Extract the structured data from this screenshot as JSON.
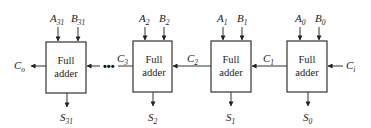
{
  "colors": {
    "line": "#333333",
    "text": "#222222",
    "background": "#ffffff"
  },
  "block_label": {
    "line1": "Full",
    "line2": "adder"
  },
  "stages": [
    {
      "a": "A",
      "a_sub": "31",
      "b": "B",
      "b_sub": "31",
      "s": "S",
      "s_sub": "31"
    },
    {
      "a": "A",
      "a_sub": "2",
      "b": "B",
      "b_sub": "2",
      "s": "S",
      "s_sub": "2"
    },
    {
      "a": "A",
      "a_sub": "1",
      "b": "B",
      "b_sub": "1",
      "s": "S",
      "s_sub": "1"
    },
    {
      "a": "A",
      "a_sub": "0",
      "b": "B",
      "b_sub": "0",
      "s": "S",
      "s_sub": "0"
    }
  ],
  "carries": {
    "out": {
      "base": "C",
      "sub": "o"
    },
    "c3": {
      "base": "C",
      "sub": "3"
    },
    "c2": {
      "base": "C",
      "sub": "2"
    },
    "c1": {
      "base": "C",
      "sub": "1"
    },
    "in": {
      "base": "C",
      "sub": "i"
    }
  },
  "ellipsis": "•••"
}
